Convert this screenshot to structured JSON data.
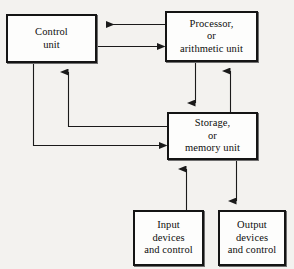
{
  "diagram": {
    "background_color": "#f3f2ef",
    "box_fill_color": "#fdfdfc",
    "line_color": "#1a1a1a",
    "nodes": [
      {
        "id": "control",
        "name": "control-unit",
        "lines": [
          "Control",
          "unit"
        ]
      },
      {
        "id": "processor",
        "name": "processor-unit",
        "lines": [
          "Processor,",
          "or",
          "arithmetic unit"
        ]
      },
      {
        "id": "storage",
        "name": "storage-unit",
        "lines": [
          "Storage,",
          "or",
          "memory unit"
        ]
      },
      {
        "id": "input",
        "name": "input-devices",
        "lines": [
          "Input",
          "devices",
          "and control"
        ]
      },
      {
        "id": "output",
        "name": "output-devices",
        "lines": [
          "Output",
          "devices",
          "and control"
        ]
      }
    ],
    "connectors": [
      {
        "id": "processor-to-control",
        "from": "processor",
        "to": "control",
        "direction": "left",
        "arrow": true
      },
      {
        "id": "control-to-processor",
        "from": "control",
        "to": "processor",
        "direction": "right",
        "arrow": true
      },
      {
        "id": "processor-to-storage",
        "from": "processor",
        "to": "storage",
        "direction": "down",
        "arrow": true
      },
      {
        "id": "storage-to-processor",
        "from": "storage",
        "to": "processor",
        "direction": "up",
        "arrow": true
      },
      {
        "id": "storage-to-control",
        "from": "storage",
        "to": "control",
        "direction": "up",
        "arrow": true
      },
      {
        "id": "control-to-storage",
        "from": "control",
        "to": "storage",
        "direction": "right",
        "arrow": true
      },
      {
        "id": "input-to-storage",
        "from": "input",
        "to": "storage",
        "direction": "up",
        "arrow": true
      },
      {
        "id": "storage-to-output",
        "from": "storage",
        "to": "output",
        "direction": "down",
        "arrow": true
      }
    ]
  }
}
